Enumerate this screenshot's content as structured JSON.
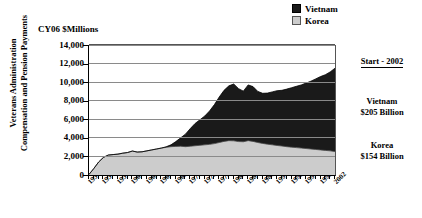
{
  "units_caption": "CY06 $Millions",
  "y_axis_title_line1": "Veterans Administration",
  "y_axis_title_line2": "Compensation and Pension Payments",
  "legend": {
    "position": "top-right",
    "items": [
      {
        "label": "Vietnam",
        "color": "#1a1a1a",
        "swatch": "filled-square-icon"
      },
      {
        "label": "Korea",
        "color": "#cccccc",
        "swatch": "filled-square-icon"
      }
    ]
  },
  "annotations": {
    "start_label": "Start - 2002",
    "vietnam_name": "Vietnam",
    "vietnam_total": "$205 Billion",
    "korea_name": "Korea",
    "korea_total": "$154 Billion"
  },
  "chart_data": {
    "type": "area",
    "stacked": true,
    "title": "",
    "subtitle": "",
    "xlabel": "",
    "ylabel": "Veterans Administration Compensation and Pension Payments",
    "units": "CY06 $Millions",
    "ylim": [
      0,
      14000
    ],
    "ytick_values": [
      0,
      2000,
      4000,
      6000,
      8000,
      10000,
      12000,
      14000
    ],
    "ytick_labels": [
      "0",
      "2,000",
      "4,000",
      "6,000",
      "8,000",
      "10,000",
      "12,000",
      "14,000"
    ],
    "grid": true,
    "grid_axis": "y",
    "legend_position": "top-right",
    "x": [
      1951,
      1952,
      1953,
      1954,
      1955,
      1956,
      1957,
      1958,
      1959,
      1960,
      1961,
      1962,
      1963,
      1964,
      1965,
      1966,
      1967,
      1968,
      1969,
      1970,
      1971,
      1972,
      1973,
      1974,
      1975,
      1976,
      1977,
      1978,
      1979,
      1980,
      1981,
      1982,
      1983,
      1984,
      1985,
      1986,
      1987,
      1988,
      1989,
      1990,
      1991,
      1992,
      1993,
      1994,
      1995,
      1996,
      1997,
      1998,
      1999,
      2000,
      2001,
      2002
    ],
    "xtick_labels": [
      "1951",
      "1954",
      "1957",
      "1960",
      "1963",
      "1966",
      "1969",
      "1972",
      "1975",
      "1978",
      "1981",
      "1984",
      "1987",
      "1990",
      "1993",
      "1996",
      "1999",
      "2002"
    ],
    "xtick_step_years": 3,
    "xlim": [
      1951,
      2002
    ],
    "series": [
      {
        "name": "Korea",
        "color": "#cccccc",
        "total_label": "$154 Billion",
        "values": [
          60,
          700,
          1400,
          1900,
          2150,
          2200,
          2250,
          2350,
          2420,
          2580,
          2470,
          2500,
          2600,
          2700,
          2800,
          2900,
          2980,
          3050,
          3080,
          3100,
          3050,
          3100,
          3150,
          3200,
          3250,
          3300,
          3380,
          3500,
          3620,
          3700,
          3680,
          3600,
          3580,
          3700,
          3620,
          3500,
          3400,
          3320,
          3250,
          3180,
          3120,
          3050,
          3000,
          2950,
          2900,
          2850,
          2800,
          2750,
          2700,
          2650,
          2600,
          2520
        ]
      },
      {
        "name": "Vietnam",
        "color": "#1a1a1a",
        "total_label": "$205 Billion",
        "values": [
          0,
          0,
          0,
          0,
          0,
          0,
          0,
          0,
          0,
          0,
          0,
          0,
          0,
          0,
          0,
          0,
          60,
          200,
          520,
          900,
          1350,
          1900,
          2400,
          2750,
          3100,
          3600,
          4200,
          4900,
          5500,
          5900,
          6120,
          5700,
          5450,
          6000,
          5900,
          5500,
          5400,
          5500,
          5700,
          5900,
          6000,
          6200,
          6400,
          6600,
          6800,
          7050,
          7300,
          7600,
          7900,
          8150,
          8500,
          8980
        ]
      }
    ],
    "stack_totals": [
      60,
      700,
      1400,
      1900,
      2150,
      2200,
      2250,
      2350,
      2420,
      2580,
      2470,
      2500,
      2600,
      2700,
      2800,
      2900,
      3040,
      3250,
      3600,
      4000,
      4400,
      5000,
      5550,
      5950,
      6350,
      6900,
      7580,
      8400,
      9120,
      9600,
      9800,
      9300,
      9030,
      9700,
      9520,
      9000,
      8800,
      8820,
      8950,
      9080,
      9120,
      9250,
      9400,
      9550,
      9700,
      9900,
      10100,
      10350,
      10600,
      10800,
      11100,
      11500
    ]
  }
}
